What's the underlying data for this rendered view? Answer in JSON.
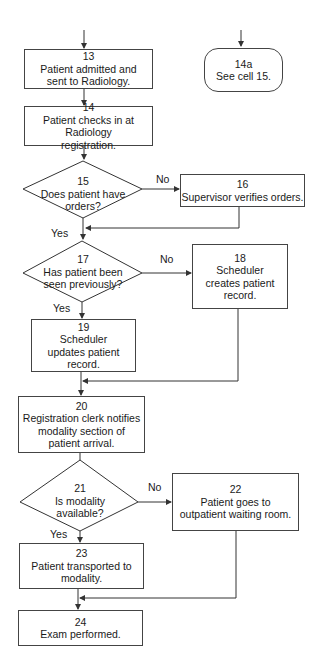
{
  "diagram": {
    "type": "flowchart",
    "nodes": {
      "n13": {
        "id": "13",
        "shape": "process",
        "text": "Patient admitted and sent to Radiology."
      },
      "n14a": {
        "id": "14a",
        "shape": "terminator",
        "text": "See cell 15."
      },
      "n14": {
        "id": "14",
        "shape": "process",
        "text": "Patient checks in at Radiology registration."
      },
      "n15": {
        "id": "15",
        "shape": "decision",
        "text": "Does patient have orders?"
      },
      "n16": {
        "id": "16",
        "shape": "process",
        "text": "Supervisor verifies orders."
      },
      "n17": {
        "id": "17",
        "shape": "decision",
        "text": "Has patient been seen previously?"
      },
      "n18": {
        "id": "18",
        "shape": "process",
        "text": "Scheduler creates patient record."
      },
      "n19": {
        "id": "19",
        "shape": "process",
        "text": "Scheduler updates patient record."
      },
      "n20": {
        "id": "20",
        "shape": "process",
        "text": "Registration clerk notifies modality section of patient arrival."
      },
      "n21": {
        "id": "21",
        "shape": "decision",
        "text": "Is modality available?"
      },
      "n22": {
        "id": "22",
        "shape": "process",
        "text": "Patient goes to outpatient waiting room."
      },
      "n23": {
        "id": "23",
        "shape": "process",
        "text": "Patient transported to modality."
      },
      "n24": {
        "id": "24",
        "shape": "process",
        "text": "Exam performed."
      }
    },
    "labels": {
      "yes": "Yes",
      "no": "No"
    },
    "edges": [
      {
        "from": "13",
        "to": "14"
      },
      {
        "from": "14",
        "to": "15"
      },
      {
        "from": "15",
        "to": "16",
        "label": "No"
      },
      {
        "from": "15",
        "to": "17",
        "label": "Yes"
      },
      {
        "from": "16",
        "to": "17"
      },
      {
        "from": "17",
        "to": "18",
        "label": "No"
      },
      {
        "from": "17",
        "to": "19",
        "label": "Yes"
      },
      {
        "from": "18",
        "to": "20"
      },
      {
        "from": "19",
        "to": "20"
      },
      {
        "from": "20",
        "to": "21"
      },
      {
        "from": "21",
        "to": "22",
        "label": "No"
      },
      {
        "from": "21",
        "to": "23",
        "label": "Yes"
      },
      {
        "from": "22",
        "to": "24"
      },
      {
        "from": "23",
        "to": "24"
      }
    ],
    "colors": {
      "line": "#333333",
      "background": "#ffffff",
      "text": "#1a1a1a"
    }
  }
}
